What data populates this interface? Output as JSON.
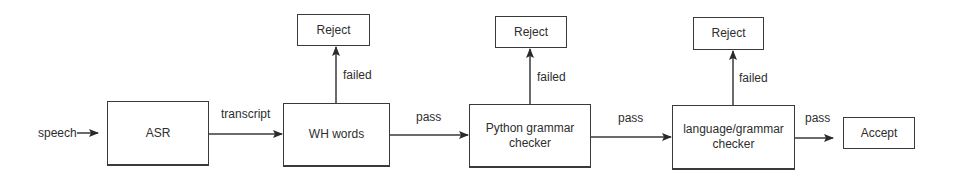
{
  "diagram": {
    "input": {
      "label": "speech"
    },
    "nodes": [
      {
        "id": "asr",
        "label": "ASR"
      },
      {
        "id": "wh",
        "label": "WH words"
      },
      {
        "id": "python",
        "label_lines": [
          "Python grammar",
          "checker"
        ]
      },
      {
        "id": "language",
        "label_lines": [
          "language/grammar",
          "checker"
        ]
      },
      {
        "id": "accept",
        "label": "Accept"
      }
    ],
    "rejects": [
      {
        "id": "reject1",
        "label": "Reject"
      },
      {
        "id": "reject2",
        "label": "Reject"
      },
      {
        "id": "reject3",
        "label": "Reject"
      }
    ],
    "edges": {
      "asr_to_wh": "transcript",
      "wh_to_python": "pass",
      "python_to_language": "pass",
      "language_to_accept": "pass",
      "wh_fail": "failed",
      "python_fail": "failed",
      "language_fail": "failed"
    },
    "colors": {
      "line": "#3a3a3a",
      "text": "#2e2e2e",
      "background": "#ffffff"
    }
  }
}
